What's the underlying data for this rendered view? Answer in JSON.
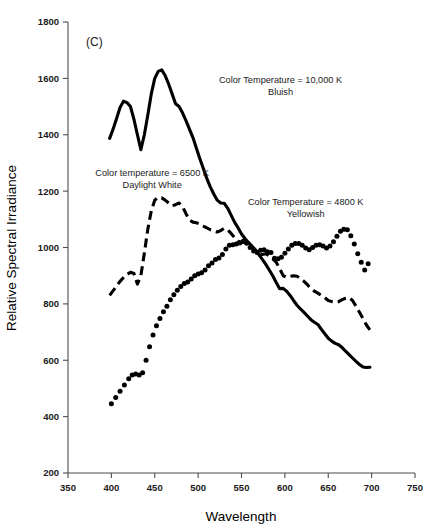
{
  "figure": {
    "panel_label": "(C)",
    "background_color": "#ffffff",
    "line_color": "#000000",
    "axis_color": "#4d4d4d"
  },
  "chart_data": {
    "type": "line",
    "title": "",
    "subtitle": "",
    "panel": "(C)",
    "xlabel": "Wavelength",
    "ylabel": "Relative Spectral Irradiance",
    "xlim": [
      350,
      750
    ],
    "ylim": [
      200,
      1800
    ],
    "xticks": [
      350,
      400,
      450,
      500,
      550,
      600,
      650,
      700,
      750
    ],
    "yticks": [
      200,
      400,
      600,
      800,
      1000,
      1200,
      1400,
      1600,
      1800
    ],
    "grid": false,
    "legend_position": "inline-annotations",
    "annotations": [
      {
        "id": "annot-10000k",
        "line1": "Color Temperature = 10,000 K",
        "line2": "Bluish",
        "x": 595,
        "y": 1585,
        "series_ref": "10000K"
      },
      {
        "id": "annot-6500k",
        "line1": "Color temperature = 6500 K",
        "line2": "Daylight White",
        "x": 447,
        "y": 1255,
        "series_ref": "6500K"
      },
      {
        "id": "annot-4800k",
        "line1": "Color Temperature = 4800 K",
        "line2": "Yellowish",
        "x": 624,
        "y": 1150,
        "series_ref": "4800K"
      }
    ],
    "series": [
      {
        "name": "10000K",
        "label": "Color Temperature = 10,000 K Bluish",
        "style": "solid",
        "color": "#000000",
        "x": [
          398,
          402,
          406,
          410,
          414,
          418,
          422,
          426,
          430,
          434,
          438,
          442,
          446,
          450,
          454,
          458,
          462,
          466,
          470,
          474,
          478,
          482,
          486,
          490,
          494,
          498,
          502,
          506,
          510,
          514,
          518,
          522,
          526,
          530,
          534,
          538,
          542,
          546,
          550,
          554,
          558,
          562,
          566,
          570,
          574,
          578,
          582,
          586,
          590,
          594,
          598,
          602,
          606,
          610,
          614,
          618,
          622,
          626,
          630,
          634,
          638,
          642,
          646,
          650,
          654,
          658,
          662,
          666,
          670,
          674,
          678,
          682,
          686,
          690,
          694,
          698
        ],
        "values": [
          1387,
          1420,
          1458,
          1497,
          1519,
          1514,
          1500,
          1455,
          1400,
          1347,
          1400,
          1470,
          1545,
          1600,
          1625,
          1630,
          1610,
          1580,
          1545,
          1510,
          1500,
          1478,
          1450,
          1420,
          1390,
          1352,
          1315,
          1280,
          1245,
          1215,
          1190,
          1168,
          1158,
          1157,
          1140,
          1115,
          1090,
          1070,
          1048,
          1032,
          1018,
          1005,
          992,
          975,
          958,
          940,
          920,
          900,
          876,
          854,
          855,
          845,
          830,
          812,
          795,
          782,
          770,
          757,
          744,
          735,
          727,
          710,
          694,
          678,
          668,
          660,
          655,
          645,
          632,
          620,
          608,
          596,
          585,
          576,
          574,
          575
        ]
      },
      {
        "name": "6500K",
        "label": "Color temperature = 6500 K Daylight White",
        "style": "dashed",
        "color": "#000000",
        "x": [
          398,
          404,
          410,
          416,
          422,
          426,
          430,
          434,
          438,
          442,
          446,
          450,
          454,
          458,
          462,
          466,
          470,
          474,
          478,
          482,
          486,
          490,
          494,
          498,
          502,
          506,
          510,
          514,
          518,
          522,
          526,
          530,
          534,
          538,
          542,
          546,
          550,
          554,
          558,
          562,
          566,
          570,
          574,
          578,
          582,
          586,
          590,
          594,
          598,
          602,
          606,
          610,
          614,
          618,
          622,
          626,
          630,
          634,
          638,
          642,
          646,
          650,
          654,
          658,
          662,
          666,
          670,
          674,
          678,
          682,
          686,
          690,
          694,
          698
        ],
        "values": [
          830,
          855,
          880,
          900,
          912,
          908,
          870,
          900,
          980,
          1065,
          1130,
          1168,
          1178,
          1176,
          1168,
          1158,
          1148,
          1152,
          1158,
          1145,
          1120,
          1098,
          1090,
          1088,
          1083,
          1076,
          1070,
          1063,
          1058,
          1055,
          1060,
          1068,
          1063,
          1050,
          1035,
          1022,
          1018,
          1020,
          1012,
          1000,
          988,
          976,
          975,
          978,
          970,
          960,
          948,
          925,
          900,
          895,
          898,
          900,
          898,
          890,
          880,
          868,
          855,
          845,
          838,
          830,
          822,
          812,
          808,
          806,
          808,
          815,
          820,
          822,
          812,
          792,
          770,
          748,
          725,
          708
        ]
      },
      {
        "name": "4800K",
        "label": "Color Temperature = 4800 K Yellowish",
        "style": "dotted",
        "color": "#000000",
        "x": [
          400,
          405,
          410,
          415,
          420,
          424,
          428,
          432,
          436,
          440,
          444,
          448,
          452,
          456,
          460,
          464,
          468,
          472,
          476,
          480,
          484,
          488,
          492,
          496,
          500,
          504,
          508,
          512,
          516,
          520,
          524,
          528,
          532,
          536,
          540,
          544,
          548,
          552,
          556,
          560,
          564,
          568,
          572,
          576,
          580,
          584,
          588,
          592,
          596,
          600,
          604,
          608,
          612,
          616,
          620,
          624,
          628,
          632,
          636,
          640,
          644,
          648,
          652,
          656,
          660,
          664,
          668,
          672,
          676,
          680,
          684,
          688,
          692,
          696
        ],
        "values": [
          446,
          468,
          490,
          512,
          534,
          548,
          551,
          548,
          556,
          600,
          648,
          690,
          722,
          748,
          772,
          792,
          815,
          832,
          848,
          862,
          872,
          878,
          888,
          900,
          906,
          910,
          920,
          935,
          945,
          957,
          963,
          975,
          995,
          1008,
          1010,
          1012,
          1016,
          1022,
          1015,
          1000,
          988,
          982,
          990,
          992,
          985,
          982,
          962,
          960,
          965,
          980,
          995,
          1008,
          1014,
          1014,
          1008,
          998,
          992,
          1000,
          1008,
          1010,
          1005,
          998,
          1005,
          1020,
          1040,
          1058,
          1065,
          1063,
          1042,
          1012,
          978,
          948,
          920,
          942
        ]
      }
    ]
  }
}
